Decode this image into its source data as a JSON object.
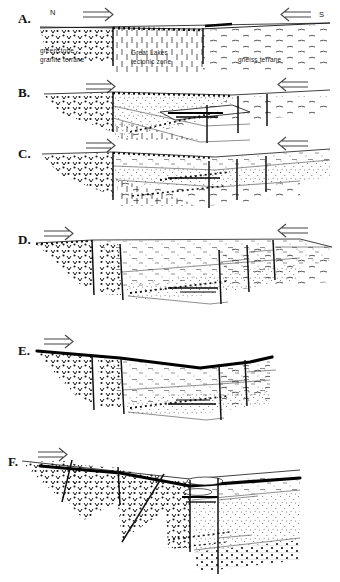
{
  "figure": {
    "panel_count": 6,
    "width": 340,
    "height": 582
  },
  "compass": {
    "north_label": "N",
    "south_label": "S",
    "north_arrow_icon": "arrow-right-double",
    "south_arrow_icon": "arrow-left-double"
  },
  "unit_labels": {
    "left": "greenstone -\ngranite terrane",
    "left_line1": "greenstone -",
    "left_line2": "granite terrane",
    "center_line1": "Great Lakes",
    "center_line2": "tectonic zone",
    "right": "gneiss  terrane"
  },
  "panels": [
    {
      "letter": "A.",
      "y": 22,
      "has_unit_labels": true,
      "has_compass_labels": true
    },
    {
      "letter": "B.",
      "y": 96,
      "has_unit_labels": false,
      "has_compass_labels": false
    },
    {
      "letter": "C.",
      "y": 157,
      "has_unit_labels": false,
      "has_compass_labels": false
    },
    {
      "letter": "D.",
      "y": 243,
      "has_unit_labels": false,
      "has_compass_labels": false
    },
    {
      "letter": "E.",
      "y": 352,
      "has_unit_labels": false,
      "has_compass_labels": false
    },
    {
      "letter": "F.",
      "y": 463,
      "has_unit_labels": false,
      "has_compass_labels": false
    }
  ],
  "patterns": {
    "greenstone_granite": "v-triangle-stipple",
    "tectonic_zone": "vertical-dash",
    "gneiss": "horizontal-dash-lenticular",
    "sediment": "fine-stipple",
    "conglomerate": "coarse-dot"
  },
  "colors": {
    "ink": "#111111",
    "paper": "#ffffff",
    "light_ink": "#444444"
  }
}
